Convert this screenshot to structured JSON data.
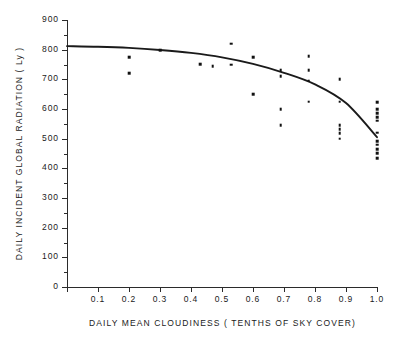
{
  "chart_data": {
    "type": "scatter",
    "title": "",
    "xlabel": "DAILY  MEAN  CLOUDINESS ( TENTHS  OF  SKY  COVER)",
    "ylabel": "DAILY INCIDENT GLOBAL  RADIATION   ( Ly )",
    "xlim": [
      0.0,
      1.0
    ],
    "ylim": [
      0,
      900
    ],
    "grid": false,
    "legend": "none",
    "xticks": [
      0.0,
      0.1,
      0.2,
      0.3,
      0.4,
      0.5,
      0.6,
      0.7,
      0.8,
      0.9,
      1.0
    ],
    "xtick_labels": [
      "",
      "0.1",
      "0.2",
      "0.3",
      "0.4",
      "0.5",
      "0.6",
      "0.7",
      "0.8",
      "0.9",
      "1.0"
    ],
    "yticks": [
      0,
      100,
      200,
      300,
      400,
      500,
      600,
      700,
      800,
      900
    ],
    "ytick_labels": [
      "0",
      "100",
      "200",
      "300",
      "400",
      "500",
      "600",
      "700",
      "800",
      "900"
    ],
    "yticks_minor": [
      50,
      150,
      250,
      350,
      450,
      550,
      650,
      750,
      850
    ],
    "points": [
      {
        "x": 0.2,
        "y": 720
      },
      {
        "x": 0.2,
        "y": 775
      },
      {
        "x": 0.3,
        "y": 798
      },
      {
        "x": 0.43,
        "y": 752
      },
      {
        "x": 0.47,
        "y": 745
      },
      {
        "x": 0.53,
        "y": 820
      },
      {
        "x": 0.53,
        "y": 750
      },
      {
        "x": 0.6,
        "y": 775
      },
      {
        "x": 0.6,
        "y": 650
      },
      {
        "x": 0.69,
        "y": 730
      },
      {
        "x": 0.69,
        "y": 710
      },
      {
        "x": 0.69,
        "y": 600
      },
      {
        "x": 0.69,
        "y": 545
      },
      {
        "x": 0.78,
        "y": 778
      },
      {
        "x": 0.78,
        "y": 730
      },
      {
        "x": 0.78,
        "y": 695
      },
      {
        "x": 0.78,
        "y": 625
      },
      {
        "x": 0.88,
        "y": 700
      },
      {
        "x": 0.88,
        "y": 625
      },
      {
        "x": 0.88,
        "y": 545
      },
      {
        "x": 0.88,
        "y": 532
      },
      {
        "x": 0.88,
        "y": 518
      },
      {
        "x": 0.88,
        "y": 500
      },
      {
        "x": 1.0,
        "y": 622
      },
      {
        "x": 1.0,
        "y": 600
      },
      {
        "x": 1.0,
        "y": 585
      },
      {
        "x": 1.0,
        "y": 572
      },
      {
        "x": 1.0,
        "y": 560
      },
      {
        "x": 1.0,
        "y": 520
      },
      {
        "x": 1.0,
        "y": 492
      },
      {
        "x": 1.0,
        "y": 480
      },
      {
        "x": 1.0,
        "y": 465
      },
      {
        "x": 1.0,
        "y": 452
      },
      {
        "x": 1.0,
        "y": 435
      }
    ],
    "fit_curve": {
      "name": "regression-curve",
      "x": [
        0.0,
        0.1,
        0.2,
        0.3,
        0.4,
        0.5,
        0.6,
        0.7,
        0.8,
        0.9,
        1.0
      ],
      "y": [
        812,
        810,
        806,
        799,
        789,
        774,
        752,
        722,
        683,
        620,
        505
      ]
    },
    "marker_color": "#111111",
    "line_color": "#1a1a1a",
    "background_color": "#ffffff"
  }
}
